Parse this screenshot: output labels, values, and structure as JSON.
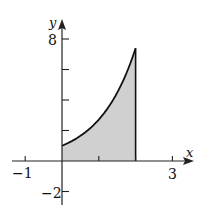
{
  "chart_data": {
    "type": "area",
    "title": "",
    "xlabel": "x",
    "ylabel": "y",
    "function": "y = e^x",
    "shaded_interval": [
      0,
      2
    ],
    "x": [
      0,
      0.25,
      0.5,
      0.75,
      1,
      1.25,
      1.5,
      1.75,
      2
    ],
    "values": [
      1,
      1.28,
      1.65,
      2.12,
      2.72,
      3.49,
      4.48,
      5.75,
      7.39
    ],
    "xlim": [
      -1.4,
      3.5
    ],
    "ylim": [
      -2.9,
      9.7
    ],
    "x_ticks": [
      -1,
      1,
      2,
      3
    ],
    "x_tick_labels": [
      "-1",
      "3"
    ],
    "y_ticks": [
      -2,
      2,
      4,
      6,
      8
    ],
    "y_tick_labels": [
      "-2",
      "8"
    ],
    "grid": false,
    "legend": "none",
    "colors": {
      "fill": "#d0d0d0",
      "stroke": "#111111",
      "axis": "#222222"
    }
  },
  "labels": {
    "x_axis": "x",
    "y_axis": "y",
    "x_neg1": "−1",
    "x_3": "3",
    "y_8": "8",
    "y_neg2": "−2"
  }
}
